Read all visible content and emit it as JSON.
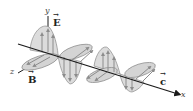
{
  "diagram": {
    "type": "electromagnetic-wave",
    "axes": {
      "x": "x",
      "y": "y",
      "z": "z"
    },
    "vectors": {
      "electric": "E",
      "magnetic": "B",
      "velocity": "c"
    },
    "colors": {
      "lobe_fill": "#d9d9d9",
      "lobe_stroke": "#8a8a8a",
      "arrow": "#8c8c8c",
      "axis": "#1a1a1a"
    }
  }
}
